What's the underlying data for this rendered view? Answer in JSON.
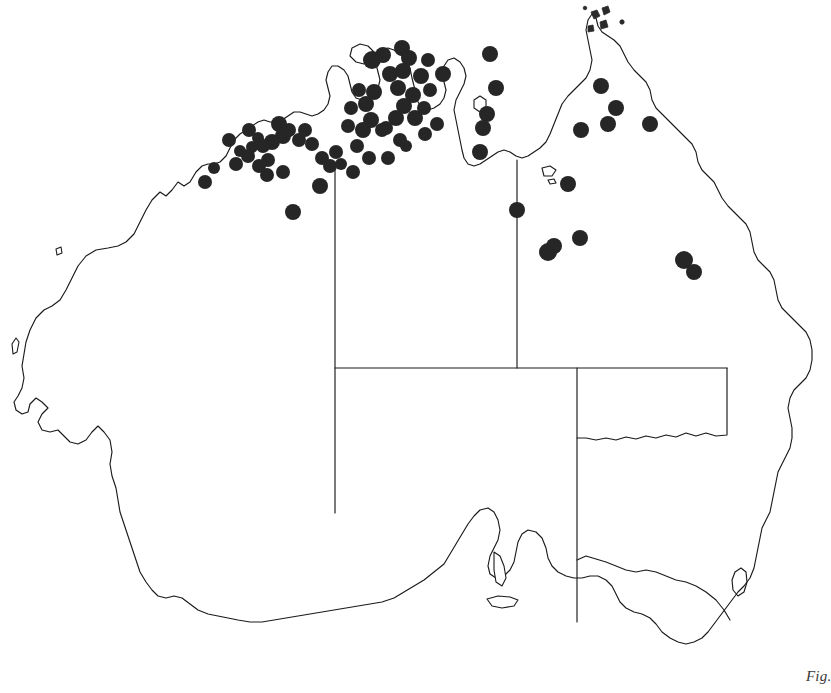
{
  "figure": {
    "caption_fragment": "Fig.",
    "background_color": "#ffffff",
    "outline_color": "#1a1a1a",
    "dot_color": "#262626",
    "width": 831,
    "height": 693
  },
  "map": {
    "region_name": "Australia",
    "projection_note": "outline map, Tasmania omitted",
    "states_shown": [
      "Western Australia",
      "Northern Territory",
      "South Australia",
      "Queensland",
      "New South Wales",
      "Victoria",
      "Australian Capital Territory"
    ],
    "internal_borders": [
      {
        "name": "wa-nt-sa-border-vertical",
        "x": 335,
        "y_top": 168,
        "y_bottom": 513
      },
      {
        "name": "nt-qld-border-vertical",
        "x": 517,
        "y_top": 160,
        "y_bottom": 368
      },
      {
        "name": "sa-nt-qld-border-horizontal",
        "y": 368,
        "x_left": 335,
        "x_right": 727
      },
      {
        "name": "sa-nsw-qld-border-vertical",
        "x": 577,
        "y_top": 368,
        "y_bottom": 620
      },
      {
        "name": "qld-nsw-border-horizontal",
        "y": 437,
        "x_left": 577,
        "x_right": 790
      }
    ]
  },
  "chart_data": {
    "type": "scatter",
    "title": "",
    "xlabel": "",
    "ylabel": "",
    "point_count": 77,
    "concentration_regions": [
      "Kimberley (WA)",
      "Top End / Darwin / Arnhem Land (NT)",
      "Gulf of Carpentaria",
      "Cape York Peninsula (QLD)",
      "Northern Queensland interior"
    ],
    "points": [
      {
        "x": 236,
        "y": 164,
        "r": 7
      },
      {
        "x": 248,
        "y": 156,
        "r": 7
      },
      {
        "x": 259,
        "y": 166,
        "r": 7
      },
      {
        "x": 268,
        "y": 160,
        "r": 7
      },
      {
        "x": 272,
        "y": 142,
        "r": 8
      },
      {
        "x": 283,
        "y": 136,
        "r": 8
      },
      {
        "x": 263,
        "y": 146,
        "r": 7
      },
      {
        "x": 252,
        "y": 147,
        "r": 6
      },
      {
        "x": 240,
        "y": 151,
        "r": 6
      },
      {
        "x": 267,
        "y": 175,
        "r": 7
      },
      {
        "x": 283,
        "y": 172,
        "r": 7
      },
      {
        "x": 293,
        "y": 212,
        "r": 8
      },
      {
        "x": 320,
        "y": 186,
        "r": 8
      },
      {
        "x": 299,
        "y": 140,
        "r": 7
      },
      {
        "x": 289,
        "y": 130,
        "r": 7
      },
      {
        "x": 279,
        "y": 124,
        "r": 8
      },
      {
        "x": 312,
        "y": 144,
        "r": 7
      },
      {
        "x": 322,
        "y": 158,
        "r": 7
      },
      {
        "x": 330,
        "y": 166,
        "r": 7
      },
      {
        "x": 336,
        "y": 152,
        "r": 7
      },
      {
        "x": 341,
        "y": 164,
        "r": 6
      },
      {
        "x": 348,
        "y": 126,
        "r": 7
      },
      {
        "x": 357,
        "y": 146,
        "r": 7
      },
      {
        "x": 363,
        "y": 130,
        "r": 8
      },
      {
        "x": 371,
        "y": 120,
        "r": 8
      },
      {
        "x": 366,
        "y": 104,
        "r": 8
      },
      {
        "x": 374,
        "y": 92,
        "r": 8
      },
      {
        "x": 372,
        "y": 60,
        "r": 9
      },
      {
        "x": 383,
        "y": 55,
        "r": 8
      },
      {
        "x": 390,
        "y": 74,
        "r": 8
      },
      {
        "x": 398,
        "y": 88,
        "r": 8
      },
      {
        "x": 403,
        "y": 71,
        "r": 8
      },
      {
        "x": 409,
        "y": 58,
        "r": 8
      },
      {
        "x": 402,
        "y": 48,
        "r": 8
      },
      {
        "x": 413,
        "y": 95,
        "r": 8
      },
      {
        "x": 404,
        "y": 106,
        "r": 8
      },
      {
        "x": 396,
        "y": 118,
        "r": 8
      },
      {
        "x": 386,
        "y": 128,
        "r": 7
      },
      {
        "x": 415,
        "y": 118,
        "r": 8
      },
      {
        "x": 424,
        "y": 108,
        "r": 7
      },
      {
        "x": 430,
        "y": 90,
        "r": 7
      },
      {
        "x": 421,
        "y": 76,
        "r": 8
      },
      {
        "x": 437,
        "y": 124,
        "r": 7
      },
      {
        "x": 443,
        "y": 74,
        "r": 8
      },
      {
        "x": 425,
        "y": 134,
        "r": 7
      },
      {
        "x": 400,
        "y": 140,
        "r": 7
      },
      {
        "x": 382,
        "y": 130,
        "r": 7
      },
      {
        "x": 369,
        "y": 158,
        "r": 7
      },
      {
        "x": 353,
        "y": 172,
        "r": 7
      },
      {
        "x": 490,
        "y": 54,
        "r": 8
      },
      {
        "x": 496,
        "y": 88,
        "r": 8
      },
      {
        "x": 487,
        "y": 114,
        "r": 8
      },
      {
        "x": 483,
        "y": 128,
        "r": 8
      },
      {
        "x": 480,
        "y": 152,
        "r": 8
      },
      {
        "x": 517,
        "y": 210,
        "r": 8
      },
      {
        "x": 548,
        "y": 252,
        "r": 9
      },
      {
        "x": 554,
        "y": 246,
        "r": 8
      },
      {
        "x": 580,
        "y": 238,
        "r": 8
      },
      {
        "x": 568,
        "y": 184,
        "r": 8
      },
      {
        "x": 581,
        "y": 130,
        "r": 8
      },
      {
        "x": 608,
        "y": 124,
        "r": 8
      },
      {
        "x": 601,
        "y": 86,
        "r": 8
      },
      {
        "x": 616,
        "y": 108,
        "r": 8
      },
      {
        "x": 650,
        "y": 124,
        "r": 8
      },
      {
        "x": 684,
        "y": 260,
        "r": 9
      },
      {
        "x": 694,
        "y": 272,
        "r": 8
      },
      {
        "x": 205,
        "y": 182,
        "r": 7
      },
      {
        "x": 214,
        "y": 168,
        "r": 6
      },
      {
        "x": 229,
        "y": 140,
        "r": 7
      },
      {
        "x": 249,
        "y": 130,
        "r": 7
      },
      {
        "x": 258,
        "y": 138,
        "r": 6
      },
      {
        "x": 305,
        "y": 130,
        "r": 7
      },
      {
        "x": 388,
        "y": 158,
        "r": 7
      },
      {
        "x": 406,
        "y": 146,
        "r": 6
      },
      {
        "x": 428,
        "y": 60,
        "r": 7
      },
      {
        "x": 359,
        "y": 90,
        "r": 7
      },
      {
        "x": 351,
        "y": 108,
        "r": 7
      }
    ]
  }
}
